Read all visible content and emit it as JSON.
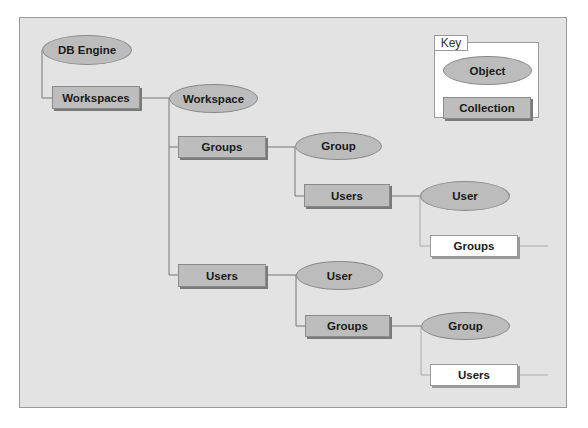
{
  "diagram": {
    "colors": {
      "panel": "#e3e3e3",
      "object_fill": "#bcbcbc",
      "collection_fill": "#bdbdbd",
      "external_fill": "#ffffff",
      "line": "#777777"
    },
    "nodes": {
      "db_engine": "DB Engine",
      "workspaces": "Workspaces",
      "workspace": "Workspace",
      "groups_1": "Groups",
      "group_1": "Group",
      "users_1": "Users",
      "user_1": "User",
      "groups_ext": "Groups",
      "users_2": "Users",
      "user_2": "User",
      "groups_2": "Groups",
      "group_2": "Group",
      "users_ext": "Users"
    },
    "key": {
      "label": "Key",
      "object": "Object",
      "collection": "Collection"
    }
  }
}
